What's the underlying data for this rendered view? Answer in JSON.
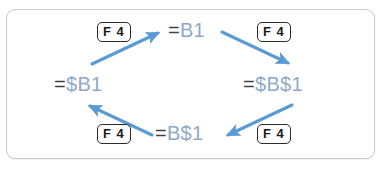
{
  "panel": {
    "border_color": "#c9c9c9",
    "background": "#ffffff"
  },
  "colors": {
    "arrow": "#5b9bd5",
    "reference_text": "#8fa9c9",
    "equals_sign": "#3f3f42",
    "key_border": "#2b2b2b",
    "key_text": "#1a1a1a"
  },
  "diagram": {
    "type": "cycle",
    "nodes": [
      {
        "id": "top",
        "equals": "=",
        "reference": "B1",
        "full": "=B1",
        "position": "top"
      },
      {
        "id": "right",
        "equals": "=",
        "reference": "$B$1",
        "full": "=$B$1",
        "position": "right"
      },
      {
        "id": "bottom",
        "equals": "=",
        "reference": "B$1",
        "full": "=B$1",
        "position": "bottom"
      },
      {
        "id": "left",
        "equals": "=",
        "reference": "$B1",
        "full": "=$B1",
        "position": "left"
      }
    ],
    "keys": [
      {
        "id": "key-top-left",
        "label": "F 4",
        "position": "top-left"
      },
      {
        "id": "key-top-right",
        "label": "F 4",
        "position": "top-right"
      },
      {
        "id": "key-bottom-left",
        "label": "F 4",
        "position": "bottom-left"
      },
      {
        "id": "key-bottom-right",
        "label": "F 4",
        "position": "bottom-right"
      }
    ],
    "arrows": [
      {
        "id": "arrow-left-to-top",
        "from": "left",
        "to": "top",
        "direction": "up-right"
      },
      {
        "id": "arrow-top-to-right",
        "from": "top",
        "to": "right",
        "direction": "down-right"
      },
      {
        "id": "arrow-right-to-bottom",
        "from": "right",
        "to": "bottom",
        "direction": "down-left"
      },
      {
        "id": "arrow-bottom-to-left",
        "from": "bottom",
        "to": "left",
        "direction": "up-left"
      }
    ]
  }
}
